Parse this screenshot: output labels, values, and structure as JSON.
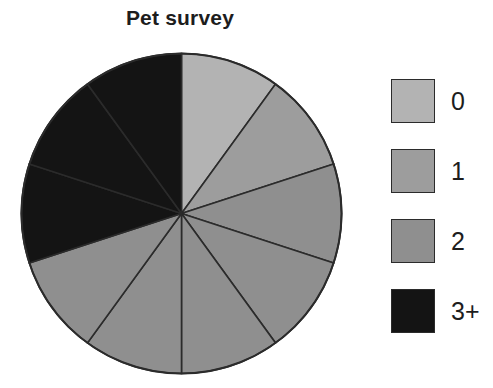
{
  "chart_data": {
    "type": "pie",
    "title": "Pet survey",
    "xlabel": "",
    "ylabel": "",
    "legend_position": "right",
    "grid": false,
    "total_slices": 10,
    "slice_angle_degrees": 36,
    "categories": [
      "0",
      "1",
      "2",
      "3+"
    ],
    "values": [
      2,
      2,
      3,
      3
    ],
    "slice_counts": {
      "0": 2,
      "1": 2,
      "2": 3,
      "3+": 3
    },
    "colors": {
      "0": "#b3b3b3",
      "1": "#9d9d9d",
      "2": "#8f8f8f",
      "3+": "#141414"
    },
    "stroke_color": "#2b2b2b",
    "slices": [
      {
        "label": "0",
        "start_deg": 0,
        "end_deg": 36,
        "color": "#b3b3b3"
      },
      {
        "label": "0",
        "start_deg": 36,
        "end_deg": 72,
        "color": "#9d9d9d"
      },
      {
        "label": "1",
        "start_deg": 72,
        "end_deg": 108,
        "color": "#8f8f8f"
      },
      {
        "label": "1",
        "start_deg": 108,
        "end_deg": 144,
        "color": "#8f8f8f"
      },
      {
        "label": "2",
        "start_deg": 144,
        "end_deg": 180,
        "color": "#8f8f8f"
      },
      {
        "label": "2",
        "start_deg": 180,
        "end_deg": 216,
        "color": "#8f8f8f"
      },
      {
        "label": "2",
        "start_deg": 216,
        "end_deg": 252,
        "color": "#8f8f8f"
      },
      {
        "label": "3+",
        "start_deg": 252,
        "end_deg": 288,
        "color": "#141414"
      },
      {
        "label": "3+",
        "start_deg": 288,
        "end_deg": 324,
        "color": "#141414"
      },
      {
        "label": "3+",
        "start_deg": 324,
        "end_deg": 360,
        "color": "#141414"
      }
    ]
  },
  "legend": {
    "items": [
      {
        "label": "0",
        "color": "#b3b3b3"
      },
      {
        "label": "1",
        "color": "#9d9d9d"
      },
      {
        "label": "2",
        "color": "#8f8f8f"
      },
      {
        "label": "3+",
        "color": "#141414"
      }
    ]
  }
}
